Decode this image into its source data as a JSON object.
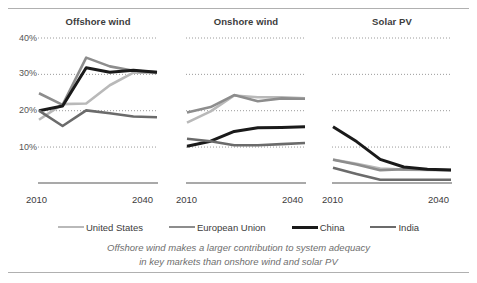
{
  "figure": {
    "caption_line1": "Offshore wind makes a larger contribution to system adequacy",
    "caption_line2": "in key markets than onshore wind and solar PV",
    "y_ticks": [
      "40%",
      "30%",
      "20%",
      "10%"
    ],
    "x_start_label": "2010",
    "x_end_label": "2040"
  },
  "legend": {
    "items": [
      {
        "label": "United States",
        "color": "#b9b9b9",
        "width": 2.6
      },
      {
        "label": "European Union",
        "color": "#8d8d8d",
        "width": 2.6
      },
      {
        "label": "China",
        "color": "#1a1a1a",
        "width": 3.0
      },
      {
        "label": "India",
        "color": "#6b6b6b",
        "width": 2.6
      }
    ]
  },
  "chart_data": {
    "type": "line",
    "subtitle": "Offshore wind makes a larger contribution to system adequacy in key markets than onshore wind and solar PV",
    "xlabel": "",
    "ylabel": "",
    "ylim": [
      0,
      42
    ],
    "yticks": [
      10,
      20,
      30,
      40
    ],
    "ytick_labels": [
      "10%",
      "20%",
      "30%",
      "40%"
    ],
    "grid": "horizontal-dotted",
    "legend_position": "bottom",
    "x": [
      2010,
      2018,
      2025,
      2030,
      2035,
      2040
    ],
    "xtick_labels": [
      "2010",
      "2040"
    ],
    "panels": [
      {
        "title": "Offshore wind",
        "series": [
          {
            "name": "United States",
            "color": "#b9b9b9",
            "values": [
              17.5,
              21.8,
              22.0,
              27.0,
              30.5,
              30.4
            ]
          },
          {
            "name": "European Union",
            "color": "#8d8d8d",
            "values": [
              24.8,
              21.6,
              34.6,
              32.2,
              31.0,
              30.6
            ]
          },
          {
            "name": "China",
            "color": "#1a1a1a",
            "values": [
              20.0,
              21.3,
              31.8,
              30.6,
              31.1,
              30.6
            ]
          },
          {
            "name": "India",
            "color": "#6b6b6b",
            "values": [
              20.0,
              15.8,
              20.1,
              19.3,
              18.4,
              18.2
            ]
          }
        ]
      },
      {
        "title": "Onshore wind",
        "series": [
          {
            "name": "United States",
            "color": "#b9b9b9",
            "values": [
              16.7,
              19.8,
              24.2,
              23.7,
              23.7,
              23.4
            ]
          },
          {
            "name": "European Union",
            "color": "#8d8d8d",
            "values": [
              19.5,
              21.0,
              24.3,
              22.6,
              23.4,
              23.3
            ]
          },
          {
            "name": "China",
            "color": "#1a1a1a",
            "values": [
              10.2,
              11.6,
              14.3,
              15.3,
              15.4,
              15.6
            ]
          },
          {
            "name": "India",
            "color": "#6b6b6b",
            "values": [
              12.3,
              11.6,
              10.5,
              10.5,
              10.8,
              11.1
            ]
          }
        ]
      },
      {
        "title": "Solar PV",
        "series": [
          {
            "name": "United States",
            "color": "#b9b9b9",
            "values": [
              6.6,
              5.4,
              4.1,
              3.8,
              3.7,
              3.6
            ]
          },
          {
            "name": "European Union",
            "color": "#8d8d8d",
            "values": [
              6.5,
              5.2,
              3.6,
              3.9,
              3.8,
              3.7
            ]
          },
          {
            "name": "China",
            "color": "#1a1a1a",
            "values": [
              15.6,
              11.5,
              6.6,
              4.5,
              3.9,
              3.7
            ]
          },
          {
            "name": "India",
            "color": "#6b6b6b",
            "values": [
              4.3,
              2.6,
              1.0,
              1.0,
              1.0,
              1.0
            ]
          }
        ]
      }
    ]
  }
}
